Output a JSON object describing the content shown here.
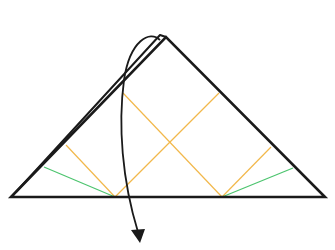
{
  "diagram": {
    "type": "origami-fold-step",
    "colors": {
      "outline": "#1a1a1a",
      "valley_crease": "#f2b84b",
      "mountain_crease": "#4cc46e",
      "arrow": "#1a1a1a",
      "background": "#ffffff"
    },
    "triangle": {
      "left": [
        11,
        197
      ],
      "apex": [
        166,
        37
      ],
      "right": [
        325,
        197
      ]
    },
    "back_layer_edge": {
      "from": [
        15,
        193
      ],
      "to": [
        160,
        36
      ],
      "apex_to": [
        166,
        37
      ]
    },
    "orange_creases": [
      {
        "from": [
          123,
          93
        ],
        "to": [
          222,
          197
        ]
      },
      {
        "from": [
          219,
          93
        ],
        "to": [
          115,
          197
        ]
      },
      {
        "from": [
          66,
          145
        ],
        "to": [
          115,
          197
        ]
      },
      {
        "from": [
          271,
          147
        ],
        "to": [
          222,
          197
        ]
      }
    ],
    "green_creases": [
      {
        "from": [
          44,
          167
        ],
        "to": [
          115,
          197
        ]
      },
      {
        "from": [
          293,
          168
        ],
        "to": [
          222,
          197
        ]
      }
    ],
    "arrow": {
      "start": [
        157,
        40
      ],
      "control1": [
        140,
        35
      ],
      "control2": [
        110,
        120
      ],
      "end": [
        139,
        242
      ],
      "direction": "down"
    }
  }
}
